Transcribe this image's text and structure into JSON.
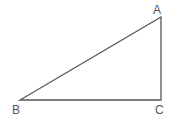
{
  "diagram": {
    "type": "right-triangle",
    "stroke_color": "#555555",
    "vertices": [
      {
        "label": "A",
        "x": 161,
        "y": 17
      },
      {
        "label": "B",
        "x": 20,
        "y": 100
      },
      {
        "label": "C",
        "x": 161,
        "y": 100
      }
    ],
    "labels": {
      "a": "A",
      "b": "B",
      "c": "C"
    }
  }
}
